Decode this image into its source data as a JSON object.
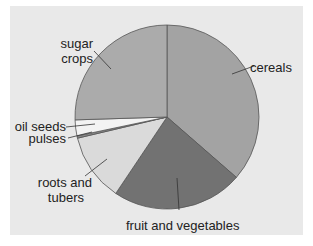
{
  "chart_data": {
    "type": "pie",
    "title": "",
    "start_angle_deg": 0,
    "direction": "clockwise",
    "slices": [
      {
        "label": "cereals",
        "value": 36.4,
        "color": "#a3a3a3"
      },
      {
        "label": "fruit and vegetables",
        "value": 23.0,
        "color": "#727272"
      },
      {
        "label": "roots and tubers",
        "value": 11.9,
        "color": "#dadada"
      },
      {
        "label": "pulses",
        "value": 0.4,
        "color": "#8a8a8a"
      },
      {
        "label": "oil seeds",
        "value": 2.8,
        "color": "#f3f3f3"
      },
      {
        "label": "sugar crops",
        "value": 25.5,
        "color": "#ababab"
      }
    ],
    "legend": "none (direct labels with leader lines)"
  },
  "labels": {
    "cereals": "cereals",
    "fruit": "fruit and vegetables",
    "roots_line1": "roots and",
    "roots_line2": "tubers",
    "pulses": "pulses",
    "oil_seeds": "oil seeds",
    "sugar_line1": "sugar",
    "sugar_line2": "crops"
  },
  "colors": {
    "panel_background": "#e9e9e9",
    "page_background": "#ffffff",
    "outline": "#555555"
  }
}
